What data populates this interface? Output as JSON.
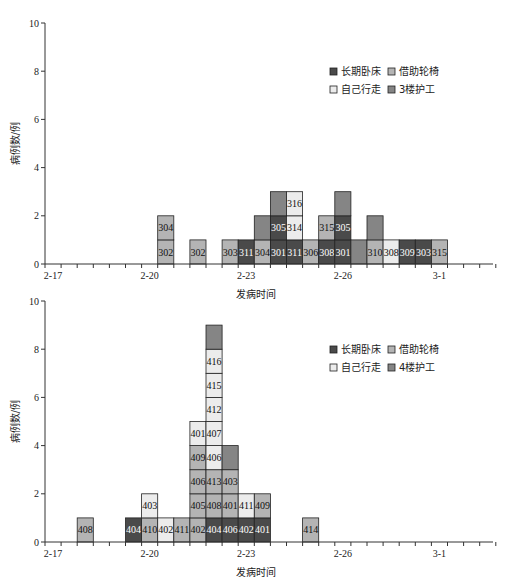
{
  "colors": {
    "长期卧床": "#4a4a4a",
    "借助轮椅": "#b4b4b4",
    "自己行走": "#ececec",
    "护工": "#858585",
    "axis": "#333333",
    "border": "#222222"
  },
  "chart_data": [
    {
      "type": "bar",
      "stacked": true,
      "title": "",
      "xlabel": "发病时间",
      "ylabel": "病例数/例",
      "ylim": [
        0,
        10
      ],
      "yticks": [
        0,
        2,
        4,
        6,
        8,
        10
      ],
      "xticks": [
        "2-17",
        "2-20",
        "2-23",
        "2-26",
        "3-1"
      ],
      "bin_unit": "half-day",
      "bins_total": 28,
      "legend": [
        "长期卧床",
        "借助轮椅",
        "自己行走",
        "3楼护工"
      ],
      "legend_position": "top-right",
      "bars": [
        {
          "bin": 7,
          "stack": [
            {
              "cat": "借助轮椅",
              "label": "302"
            },
            {
              "cat": "借助轮椅",
              "label": "304"
            }
          ]
        },
        {
          "bin": 9,
          "stack": [
            {
              "cat": "借助轮椅",
              "label": "302"
            }
          ]
        },
        {
          "bin": 11,
          "stack": [
            {
              "cat": "借助轮椅",
              "label": "303"
            }
          ]
        },
        {
          "bin": 12,
          "stack": [
            {
              "cat": "长期卧床",
              "label": "311"
            }
          ]
        },
        {
          "bin": 13,
          "stack": [
            {
              "cat": "借助轮椅",
              "label": "304"
            },
            {
              "cat": "护工",
              "label": ""
            }
          ]
        },
        {
          "bin": 14,
          "stack": [
            {
              "cat": "长期卧床",
              "label": "301"
            },
            {
              "cat": "长期卧床",
              "label": "305"
            },
            {
              "cat": "护工",
              "label": ""
            }
          ]
        },
        {
          "bin": 15,
          "stack": [
            {
              "cat": "长期卧床",
              "label": "311"
            },
            {
              "cat": "自己行走",
              "label": "314"
            },
            {
              "cat": "自己行走",
              "label": "316"
            }
          ]
        },
        {
          "bin": 16,
          "stack": [
            {
              "cat": "借助轮椅",
              "label": "306"
            }
          ]
        },
        {
          "bin": 17,
          "stack": [
            {
              "cat": "长期卧床",
              "label": "308"
            },
            {
              "cat": "借助轮椅",
              "label": "315"
            }
          ]
        },
        {
          "bin": 18,
          "stack": [
            {
              "cat": "长期卧床",
              "label": "301"
            },
            {
              "cat": "长期卧床",
              "label": "305"
            },
            {
              "cat": "护工",
              "label": ""
            }
          ]
        },
        {
          "bin": 19,
          "stack": [
            {
              "cat": "护工",
              "label": ""
            }
          ]
        },
        {
          "bin": 20,
          "stack": [
            {
              "cat": "借助轮椅",
              "label": "310"
            },
            {
              "cat": "护工",
              "label": ""
            }
          ]
        },
        {
          "bin": 21,
          "stack": [
            {
              "cat": "自己行走",
              "label": "308"
            }
          ]
        },
        {
          "bin": 22,
          "stack": [
            {
              "cat": "长期卧床",
              "label": "309"
            }
          ]
        },
        {
          "bin": 23,
          "stack": [
            {
              "cat": "长期卧床",
              "label": "303"
            }
          ]
        },
        {
          "bin": 24,
          "stack": [
            {
              "cat": "借助轮椅",
              "label": "315"
            }
          ]
        }
      ]
    },
    {
      "type": "bar",
      "stacked": true,
      "title": "",
      "xlabel": "发病时间",
      "ylabel": "病例数/例",
      "ylim": [
        0,
        10
      ],
      "yticks": [
        0,
        2,
        4,
        6,
        8,
        10
      ],
      "xticks": [
        "2-17",
        "2-20",
        "2-23",
        "2-26",
        "3-1"
      ],
      "bin_unit": "half-day",
      "bins_total": 28,
      "legend": [
        "长期卧床",
        "借助轮椅",
        "自己行走",
        "4楼护工"
      ],
      "legend_position": "top-right",
      "bars": [
        {
          "bin": 2,
          "stack": [
            {
              "cat": "借助轮椅",
              "label": "408"
            }
          ]
        },
        {
          "bin": 5,
          "stack": [
            {
              "cat": "长期卧床",
              "label": "404"
            }
          ]
        },
        {
          "bin": 6,
          "stack": [
            {
              "cat": "借助轮椅",
              "label": "410"
            },
            {
              "cat": "自己行走",
              "label": "403"
            }
          ]
        },
        {
          "bin": 7,
          "stack": [
            {
              "cat": "自己行走",
              "label": "402"
            }
          ]
        },
        {
          "bin": 8,
          "stack": [
            {
              "cat": "借助轮椅",
              "label": "411"
            }
          ]
        },
        {
          "bin": 9,
          "stack": [
            {
              "cat": "借助轮椅",
              "label": "402"
            },
            {
              "cat": "借助轮椅",
              "label": "405"
            },
            {
              "cat": "借助轮椅",
              "label": "406"
            },
            {
              "cat": "借助轮椅",
              "label": "409"
            },
            {
              "cat": "自己行走",
              "label": "401"
            }
          ]
        },
        {
          "bin": 10,
          "stack": [
            {
              "cat": "长期卧床",
              "label": "404"
            },
            {
              "cat": "借助轮椅",
              "label": "408"
            },
            {
              "cat": "借助轮椅",
              "label": "413"
            },
            {
              "cat": "自己行走",
              "label": "406"
            },
            {
              "cat": "自己行走",
              "label": "407"
            },
            {
              "cat": "自己行走",
              "label": "412"
            },
            {
              "cat": "自己行走",
              "label": "415"
            },
            {
              "cat": "自己行走",
              "label": "416"
            },
            {
              "cat": "护工",
              "label": ""
            }
          ]
        },
        {
          "bin": 11,
          "stack": [
            {
              "cat": "长期卧床",
              "label": "406"
            },
            {
              "cat": "借助轮椅",
              "label": "401"
            },
            {
              "cat": "借助轮椅",
              "label": "403"
            },
            {
              "cat": "护工",
              "label": ""
            }
          ]
        },
        {
          "bin": 12,
          "stack": [
            {
              "cat": "长期卧床",
              "label": "402"
            },
            {
              "cat": "自己行走",
              "label": "411"
            }
          ]
        },
        {
          "bin": 13,
          "stack": [
            {
              "cat": "长期卧床",
              "label": "401"
            },
            {
              "cat": "借助轮椅",
              "label": "409"
            }
          ]
        },
        {
          "bin": 16,
          "stack": [
            {
              "cat": "借助轮椅",
              "label": "414"
            }
          ]
        }
      ]
    }
  ]
}
